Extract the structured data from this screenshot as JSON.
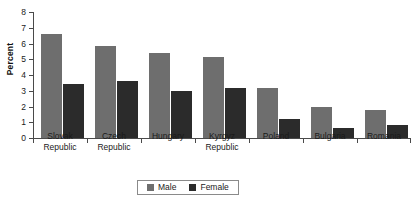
{
  "chart_data": {
    "type": "bar",
    "title": "",
    "xlabel": "",
    "ylabel": "Percent",
    "ylim": [
      0,
      8
    ],
    "yticks": [
      0,
      1,
      2,
      3,
      4,
      5,
      6,
      7,
      8
    ],
    "ytick_labels": [
      "0",
      "1",
      "2",
      "3",
      "4",
      "5",
      "6",
      "7",
      "8"
    ],
    "grid": false,
    "legend_position": "bottom-center",
    "categories": [
      "Slovak Republic",
      "Czech Republic",
      "Hungary",
      "Kyrgyz Republic",
      "Poland",
      "Bulgaria",
      "Romania"
    ],
    "category_lines": [
      [
        "Slovak",
        "Republic"
      ],
      [
        "Czech",
        "Republic"
      ],
      [
        "Hungary",
        ""
      ],
      [
        "Kyrgyz",
        "Republic"
      ],
      [
        "Poland",
        ""
      ],
      [
        "Bulgaria",
        ""
      ],
      [
        "Romania",
        ""
      ]
    ],
    "series": [
      {
        "name": "Male",
        "color": "#6e6e6e",
        "values": [
          6.6,
          5.85,
          5.4,
          5.15,
          3.15,
          2.0,
          1.8
        ]
      },
      {
        "name": "Female",
        "color": "#2b2b2b",
        "values": [
          3.45,
          3.6,
          3.0,
          3.15,
          1.2,
          0.65,
          0.85
        ]
      }
    ]
  },
  "legend": {
    "items": [
      {
        "label": "Male",
        "color": "#6e6e6e"
      },
      {
        "label": "Female",
        "color": "#2b2b2b"
      }
    ]
  },
  "colors": {
    "male": "#6e6e6e",
    "female": "#2b2b2b",
    "axis": "#4a4a4a",
    "background": "#ffffff",
    "text": "#1a1a1a"
  }
}
